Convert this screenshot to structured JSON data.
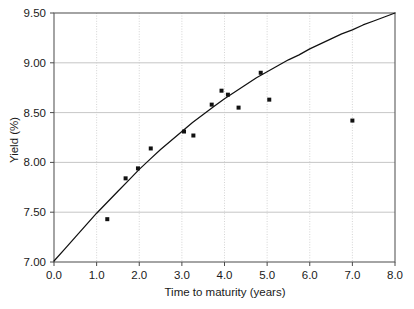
{
  "chart_data": {
    "type": "scatter",
    "title": "",
    "subtitle": "",
    "xlabel": "Time to maturity (years)",
    "ylabel": "Yield (%)",
    "xlim": [
      0.0,
      8.0
    ],
    "ylim": [
      7.0,
      9.5
    ],
    "xticks": [
      0.0,
      1.0,
      2.0,
      3.0,
      4.0,
      5.0,
      6.0,
      7.0,
      8.0
    ],
    "xtick_labels": [
      "0.0",
      "1.0",
      "2.0",
      "3.0",
      "4.0",
      "5.0",
      "6.0",
      "7.0",
      "8.0"
    ],
    "yticks": [
      7.0,
      7.5,
      8.0,
      8.5,
      9.0,
      9.5
    ],
    "ytick_labels": [
      "7.00",
      "7.50",
      "8.00",
      "8.50",
      "9.00",
      "9.50"
    ],
    "grid": {
      "horizontal": true,
      "vertical": true,
      "horizontal_style": "solid",
      "vertical_style": "dotted"
    },
    "legend": {
      "visible": false,
      "position": "none",
      "entries": []
    },
    "annotations": [],
    "series": [
      {
        "name": "Observed yields",
        "type": "scatter",
        "marker": "square",
        "marker_size": 4,
        "color": "#111111",
        "x": [
          1.25,
          1.68,
          1.97,
          2.27,
          3.05,
          3.27,
          3.7,
          3.93,
          4.08,
          4.33,
          4.85,
          5.05,
          7.0
        ],
        "y": [
          7.43,
          7.84,
          7.94,
          8.14,
          8.31,
          8.27,
          8.58,
          8.72,
          8.68,
          8.55,
          8.9,
          8.63,
          8.42
        ]
      },
      {
        "name": "Fitted yield curve",
        "type": "line",
        "color": "#111111",
        "x": [
          0.0,
          0.25,
          0.5,
          0.75,
          1.0,
          1.25,
          1.5,
          1.75,
          2.0,
          2.25,
          2.5,
          2.75,
          3.0,
          3.25,
          3.5,
          3.75,
          4.0,
          4.25,
          4.5,
          4.75,
          5.0,
          5.25,
          5.5,
          5.75,
          6.0,
          6.25,
          6.5,
          6.75,
          7.0,
          7.25,
          7.5,
          7.75,
          8.0
        ],
        "y": [
          7.01,
          7.13,
          7.25,
          7.37,
          7.49,
          7.6,
          7.71,
          7.82,
          7.93,
          8.03,
          8.13,
          8.22,
          8.31,
          8.4,
          8.48,
          8.56,
          8.64,
          8.71,
          8.78,
          8.85,
          8.91,
          8.97,
          9.03,
          9.08,
          9.14,
          9.19,
          9.24,
          9.29,
          9.33,
          9.38,
          9.42,
          9.46,
          9.5
        ]
      }
    ]
  },
  "figure": {
    "background_color": "#ffffff",
    "frame_color": "#5a5a5a",
    "axis_text_color": "#1a1a1a"
  }
}
